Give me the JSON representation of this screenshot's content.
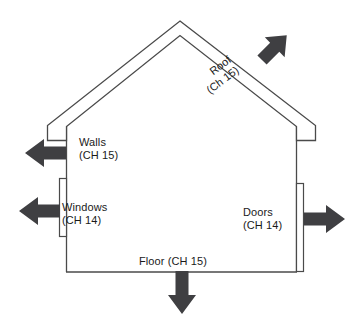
{
  "diagram": {
    "type": "house-heat-loss-schematic",
    "title": "",
    "colors": {
      "outline": "#4a4a4a",
      "arrow_fill": "#3f3f42",
      "text": "#1a1a1a",
      "background": "#ffffff"
    },
    "labels": {
      "roof": {
        "line1": "Roof",
        "line2": "(Ch 15)"
      },
      "walls": {
        "line1": "Walls",
        "line2": "(CH 15)"
      },
      "windows": {
        "line1": "Windows",
        "line2": "(CH 14)"
      },
      "doors": {
        "line1": "Doors",
        "line2": "(CH 14)"
      },
      "floor": {
        "line1": "Floor (CH 15)"
      }
    },
    "arrows": [
      {
        "name": "roof-arrow",
        "direction": "up-right",
        "angle_deg": -45
      },
      {
        "name": "walls-arrow",
        "direction": "left",
        "angle_deg": 180
      },
      {
        "name": "windows-arrow",
        "direction": "left",
        "angle_deg": 180
      },
      {
        "name": "doors-arrow",
        "direction": "right",
        "angle_deg": 0
      },
      {
        "name": "floor-arrow",
        "direction": "down",
        "angle_deg": 90
      }
    ],
    "components": [
      "roof",
      "walls",
      "windows",
      "doors",
      "floor"
    ]
  }
}
